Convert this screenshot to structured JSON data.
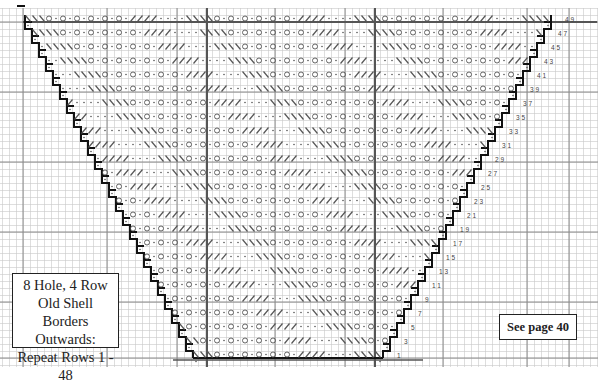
{
  "chart_title_lines": [
    "8 Hole, 4 Row",
    "Old Shell",
    "Borders Outwards:",
    "Repeat Rows 1 - 48"
  ],
  "page_reference": "See page 40",
  "grid": {
    "cell_px": 7,
    "origin_x": 23,
    "origin_y": 8,
    "cols": 82,
    "rows": 50,
    "line_color": "#c8c8c8",
    "major_line_color": "#8a8a8a",
    "heavy_line_color": "#555555",
    "outline_color": "#111111",
    "symbol_color": "#555555"
  },
  "row_numbers": [
    1,
    3,
    5,
    7,
    9,
    11,
    13,
    15,
    17,
    19,
    21,
    23,
    25,
    27,
    29,
    31,
    33,
    35,
    37,
    39,
    41,
    43,
    45,
    47,
    49
  ],
  "symbols_legend": {
    "dot": "knit",
    "circle": "yarn over",
    "backslash": "decrease left",
    "slash": "decrease right"
  },
  "heavy_vertical_cols": [
    26,
    50
  ],
  "major_vertical_cols": [
    0,
    12,
    22,
    36,
    46,
    60,
    72,
    78
  ],
  "major_horizontal_rows": [
    2,
    12,
    22,
    32,
    42,
    50
  ]
}
